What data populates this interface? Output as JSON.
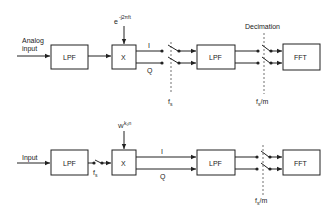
{
  "top": {
    "input_label_1": "Analog",
    "input_label_2": "input",
    "lpf1": "LPF",
    "mixer": "X",
    "osc_base": "e",
    "osc_exp": "-j2πft",
    "i": "I",
    "q": "Q",
    "fs": "f",
    "fs_sub": "s",
    "lpf2": "LPF",
    "decimation": "Decimation",
    "fsm": "f",
    "fsm_sub": "s",
    "fsm_tail": "/m",
    "fft": "FFT"
  },
  "bottom": {
    "input_label": "Input",
    "lpf1": "LPF",
    "fs": "f",
    "fs_sub": "s",
    "mixer": "X",
    "osc_base": "W",
    "osc_exp": "k₀n",
    "i": "I",
    "q": "Q",
    "lpf2": "LPF",
    "fsm": "f",
    "fsm_sub": "s",
    "fsm_tail": "/m",
    "fft": "FFT"
  }
}
